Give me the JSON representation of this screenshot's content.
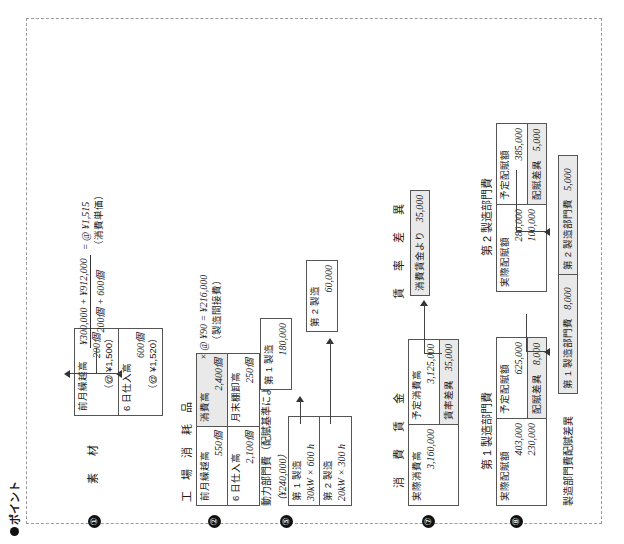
{
  "page": {
    "heading": "ポイント",
    "bullet_icon": "filled-circle"
  },
  "sections": [
    {
      "number": "①",
      "title": "素　材",
      "rows": [
        {
          "label": "前月繰越高",
          "qty": "200個",
          "unit": "（@ ¥1,500）"
        },
        {
          "label": "6 日仕入高",
          "qty": "600個",
          "unit": "（@ ¥1,520）"
        }
      ],
      "formula": {
        "numerator": "¥300,000 + ¥912,000",
        "denominator": "200個 + 600個",
        "equals": "= @ ¥1,515",
        "note": "（消費単価）"
      }
    },
    {
      "number": "②",
      "title": "工 場 消 耗 品",
      "left_rows": [
        {
          "label": "前月繰越高",
          "qty": "550個"
        },
        {
          "label": "6 日仕入高",
          "qty": "2,100個"
        }
      ],
      "right_rows": [
        {
          "label": "消費高",
          "qty": "2,400個",
          "shaded": true
        },
        {
          "label": "月末棚卸高",
          "qty": "250個",
          "shaded": false
        }
      ],
      "formula": {
        "expr": "× @ ¥90 = ¥216,000",
        "note": "（製造間接費）"
      }
    },
    {
      "number": "⑤",
      "title": "動力部門費（配賦基準による配分図）",
      "subtitle": "（¥240,000）",
      "source_rows": [
        {
          "label": "第 1 製造",
          "basis": "30kW × 600 h"
        },
        {
          "label": "第 2 製造",
          "basis": "20kW × 300 h"
        }
      ],
      "result_rows": [
        {
          "label": "第 1 製造",
          "value": "180,000"
        },
        {
          "label": "第 2 製造",
          "value": "60,000"
        }
      ]
    },
    {
      "number": "⑦",
      "title": "消　費　賃　金",
      "left_rows": [
        {
          "label": "実際消費高",
          "value": "3,160,000"
        }
      ],
      "right_rows": [
        {
          "label": "予定消費高",
          "value": "3,125,000",
          "shaded": false
        },
        {
          "label": "賃率差異",
          "value": "35,000",
          "shaded": true
        }
      ],
      "variance_box": {
        "title": "賃　率　差　異",
        "label": "消費賃金より",
        "value": "35,000"
      }
    },
    {
      "number": "⑧",
      "title": "第 1 製造部門費",
      "left_rows": [
        {
          "label": "実際配賦額",
          "values": [
            "403,000",
            "230,000"
          ]
        }
      ],
      "right_rows": [
        {
          "label": "予定配賦額",
          "value": "625,000",
          "shaded": false
        },
        {
          "label": "配賦差異",
          "value": "8,000",
          "shaded": true
        }
      ]
    },
    {
      "number": "",
      "title": "第 2 製造部門費",
      "left_rows": [
        {
          "label": "実際配賦額",
          "values": [
            "280,000",
            "100,000"
          ]
        }
      ],
      "right_rows": [
        {
          "label": "予定配賦額",
          "value": "385,000",
          "shaded": false
        },
        {
          "label": "配賦差異",
          "value": "5,000",
          "shaded": true
        }
      ]
    }
  ],
  "variance_summary": {
    "title": "製造部門費配賦差異",
    "cells": [
      {
        "label": "第 1 製造部門費",
        "value": "8,000"
      },
      {
        "label": "第 2 製造部門費",
        "value": "5,000"
      }
    ]
  },
  "colors": {
    "ink": "#1a1a1a",
    "rule": "#555555",
    "frame": "#9a9a9a",
    "shade": "#e9e9e9"
  }
}
